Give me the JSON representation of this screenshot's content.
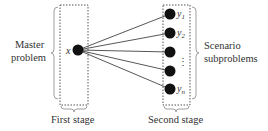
{
  "diagram": {
    "left_group": {
      "label_line1": "Master",
      "label_line2": "problem",
      "node_label": "x",
      "stage_label": "First stage"
    },
    "right_group": {
      "label_line1": "Scenario",
      "label_line2": "subproblems",
      "stage_label": "Second stage",
      "nodes": [
        {
          "var": "y",
          "sub": "1"
        },
        {
          "var": "y",
          "sub": "2"
        },
        {
          "var": "",
          "sub": ""
        },
        {
          "var": "",
          "sub": ""
        },
        {
          "var": "y",
          "sub": "n"
        }
      ],
      "ellipsis": "⋮"
    },
    "colors": {
      "node": "#111111",
      "edge": "#444444",
      "dashed_box": "#555555",
      "brace": "#888888",
      "text": "#333333"
    }
  }
}
